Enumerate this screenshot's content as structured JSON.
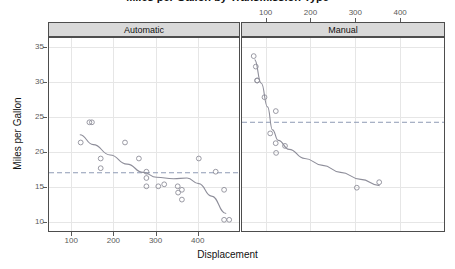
{
  "chart_data": {
    "type": "scatter",
    "title": "Miles per Gallon by Transmission Type",
    "xlabel": "Displacement",
    "ylabel": "Miles per Gallon",
    "xlim": [
      45,
      500
    ],
    "ylim": [
      8.5,
      36.5
    ],
    "grid": true,
    "legend": "none",
    "conditioned_by": "Transmission",
    "x_ticks_bottom": [
      "100",
      "200",
      "300",
      "400"
    ],
    "x_ticks_top": [
      "100",
      "200",
      "300",
      "400"
    ],
    "x_tick_values": [
      100,
      200,
      300,
      400
    ],
    "y_ticks": [
      "35",
      "30",
      "25",
      "20",
      "15",
      "10"
    ],
    "y_tick_values": [
      35,
      30,
      25,
      20,
      15,
      10
    ],
    "panels": [
      {
        "label": "Automatic",
        "reference_line": 17.15,
        "reference_line_style": "dashed",
        "points": [
          {
            "x": 120.1,
            "y": 21.5
          },
          {
            "x": 140.8,
            "y": 24.4
          },
          {
            "x": 146.7,
            "y": 24.4
          },
          {
            "x": 167.6,
            "y": 19.2
          },
          {
            "x": 167.6,
            "y": 17.8
          },
          {
            "x": 225.0,
            "y": 21.5
          },
          {
            "x": 258.0,
            "y": 19.2
          },
          {
            "x": 275.8,
            "y": 17.3
          },
          {
            "x": 275.8,
            "y": 16.4
          },
          {
            "x": 275.8,
            "y": 15.2
          },
          {
            "x": 304.0,
            "y": 15.2
          },
          {
            "x": 318.0,
            "y": 15.5
          },
          {
            "x": 350.0,
            "y": 15.2
          },
          {
            "x": 351.0,
            "y": 14.3
          },
          {
            "x": 360.0,
            "y": 14.7
          },
          {
            "x": 360.0,
            "y": 13.3
          },
          {
            "x": 400.0,
            "y": 19.2
          },
          {
            "x": 440.0,
            "y": 17.3
          },
          {
            "x": 460.0,
            "y": 14.7
          },
          {
            "x": 460.0,
            "y": 10.4
          },
          {
            "x": 472.0,
            "y": 10.4
          }
        ],
        "smoother": [
          {
            "x": 118,
            "y": 22.6
          },
          {
            "x": 150,
            "y": 21.2
          },
          {
            "x": 190,
            "y": 19.7
          },
          {
            "x": 230,
            "y": 18.4
          },
          {
            "x": 268,
            "y": 17.2
          },
          {
            "x": 300,
            "y": 16.5
          },
          {
            "x": 340,
            "y": 16.3
          },
          {
            "x": 372,
            "y": 16.4
          },
          {
            "x": 400,
            "y": 15.6
          },
          {
            "x": 430,
            "y": 13.8
          },
          {
            "x": 465,
            "y": 11.3
          }
        ]
      },
      {
        "label": "Manual",
        "reference_line": 24.4,
        "reference_line_style": "dashed",
        "points": [
          {
            "x": 71.1,
            "y": 33.9
          },
          {
            "x": 75.7,
            "y": 32.4
          },
          {
            "x": 78.7,
            "y": 30.4
          },
          {
            "x": 79.0,
            "y": 30.4
          },
          {
            "x": 95.1,
            "y": 28.0
          },
          {
            "x": 120.3,
            "y": 26.0
          },
          {
            "x": 108.0,
            "y": 22.8
          },
          {
            "x": 120.1,
            "y": 21.4
          },
          {
            "x": 140.8,
            "y": 21.0
          },
          {
            "x": 121.0,
            "y": 20.0
          },
          {
            "x": 301.0,
            "y": 15.0
          },
          {
            "x": 351.0,
            "y": 15.8
          }
        ],
        "smoother": [
          {
            "x": 73,
            "y": 33.4
          },
          {
            "x": 88,
            "y": 30.0
          },
          {
            "x": 102,
            "y": 26.6
          },
          {
            "x": 113,
            "y": 23.3
          },
          {
            "x": 126,
            "y": 21.8
          },
          {
            "x": 150,
            "y": 20.5
          },
          {
            "x": 185,
            "y": 19.2
          },
          {
            "x": 225,
            "y": 18.2
          },
          {
            "x": 265,
            "y": 17.2
          },
          {
            "x": 310,
            "y": 16.2
          },
          {
            "x": 352,
            "y": 15.3
          }
        ]
      }
    ]
  }
}
